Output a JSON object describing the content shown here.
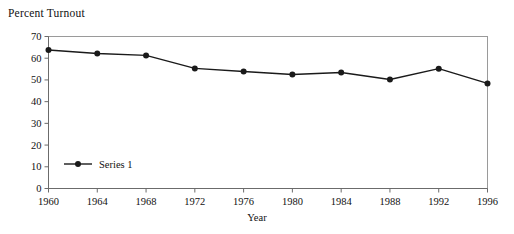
{
  "chart_data": {
    "type": "line",
    "title": "Percent Turnout",
    "xlabel": "Year",
    "ylabel": "Percent Turnout",
    "x": [
      1960,
      1964,
      1968,
      1972,
      1976,
      1980,
      1984,
      1988,
      1992,
      1996
    ],
    "categories": [
      "1960",
      "1964",
      "1968",
      "1972",
      "1976",
      "1980",
      "1984",
      "1988",
      "1992",
      "1996"
    ],
    "series": [
      {
        "name": "Series 1",
        "values": [
          63.8,
          62.2,
          61.3,
          55.3,
          53.9,
          52.5,
          53.4,
          50.2,
          55.2,
          48.4
        ]
      }
    ],
    "ylim": [
      0,
      70
    ],
    "yticks": [
      0,
      10,
      20,
      30,
      40,
      50,
      60,
      70
    ],
    "ytick_labels": [
      "0",
      "10",
      "20",
      "30",
      "40",
      "50",
      "60",
      "70"
    ],
    "xticks": [
      1960,
      1964,
      1968,
      1972,
      1976,
      1980,
      1984,
      1988,
      1992,
      1996
    ],
    "xtick_labels": [
      "1960",
      "1964",
      "1968",
      "1972",
      "1976",
      "1980",
      "1984",
      "1988",
      "1992",
      "1996"
    ],
    "grid": false,
    "legend_position": "inside-left",
    "legend_entries": [
      "Series 1"
    ],
    "colors": {
      "series_1": "#1a1a1a",
      "axis": "#6b6b6b",
      "plot_border": "#9a9a9a",
      "background": "#ffffff",
      "text": "#111111"
    }
  },
  "legend": {
    "entry_label": "Series 1"
  }
}
